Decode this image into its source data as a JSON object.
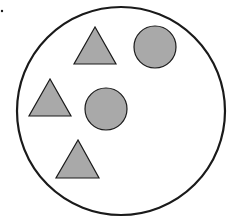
{
  "diagram": {
    "colors": {
      "stroke": "#1a1a1a",
      "fill": "#a9a9a9",
      "background": "#ffffff"
    },
    "container": {
      "shape": "circle",
      "cx": 121,
      "cy": 111,
      "r": 104
    },
    "marker_dot": {
      "cx": 2,
      "cy": 11,
      "r": 1.2
    },
    "shapes": [
      {
        "type": "triangle",
        "points": "95,27 74,64 116,64"
      },
      {
        "type": "circle",
        "cx": 155,
        "cy": 47,
        "r": 21
      },
      {
        "type": "triangle",
        "points": "50,79 29,116 71,116"
      },
      {
        "type": "circle",
        "cx": 106,
        "cy": 109,
        "r": 21
      },
      {
        "type": "triangle",
        "points": "78,140 56,178 99,178"
      }
    ],
    "counts": {
      "triangles": 3,
      "circles": 2
    }
  }
}
